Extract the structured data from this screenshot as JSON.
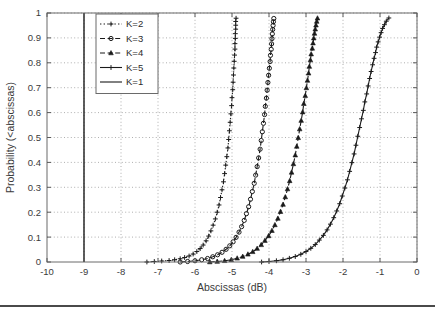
{
  "figure": {
    "bottom_rule_color": "#4a4a4a",
    "background": "#ffffff"
  },
  "chart_data": {
    "type": "line",
    "title": "",
    "subtitle": "",
    "xlabel": "Abscissas (dB)",
    "ylabel": "Probability (<abscissas)",
    "xlim": [
      -10,
      0
    ],
    "ylim": [
      0,
      1
    ],
    "xticks": [
      -10,
      -9,
      -8,
      -7,
      -6,
      -5,
      -4,
      -3,
      -2,
      -1,
      0
    ],
    "xticklabels": [
      "-10",
      "-9",
      "-8",
      "-7",
      "-6",
      "-5",
      "-4",
      "-3",
      "-2",
      "-1",
      "0"
    ],
    "yticks": [
      0,
      0.1,
      0.2,
      0.3,
      0.4,
      0.5,
      0.6,
      0.7,
      0.8,
      0.9,
      1
    ],
    "yticklabels": [
      "0",
      "0.1",
      "0.2",
      "0.3",
      "0.4",
      "0.5",
      "0.6",
      "0.7",
      "0.8",
      "0.9",
      "1"
    ],
    "grid": true,
    "grid_style": "dotted",
    "grid_color": "#9a9a9a",
    "legend_position": "upper left",
    "line_color": "#1a1a1a",
    "series": [
      {
        "name": "K=2",
        "legend_label": "K=2",
        "linestyle": "dotted",
        "marker": "plus",
        "color": "#1a1a1a",
        "points": [
          [
            -7.3,
            0.0
          ],
          [
            -7.1,
            0.002
          ],
          [
            -6.9,
            0.004
          ],
          [
            -6.7,
            0.006
          ],
          [
            -6.55,
            0.009
          ],
          [
            -6.4,
            0.013
          ],
          [
            -6.28,
            0.018
          ],
          [
            -6.16,
            0.024
          ],
          [
            -6.05,
            0.032
          ],
          [
            -5.95,
            0.042
          ],
          [
            -5.86,
            0.054
          ],
          [
            -5.78,
            0.068
          ],
          [
            -5.7,
            0.085
          ],
          [
            -5.63,
            0.104
          ],
          [
            -5.57,
            0.125
          ],
          [
            -5.51,
            0.148
          ],
          [
            -5.45,
            0.173
          ],
          [
            -5.4,
            0.2
          ],
          [
            -5.35,
            0.229
          ],
          [
            -5.31,
            0.259
          ],
          [
            -5.27,
            0.29
          ],
          [
            -5.23,
            0.322
          ],
          [
            -5.2,
            0.355
          ],
          [
            -5.17,
            0.389
          ],
          [
            -5.14,
            0.423
          ],
          [
            -5.11,
            0.458
          ],
          [
            -5.09,
            0.492
          ],
          [
            -5.07,
            0.527
          ],
          [
            -5.05,
            0.561
          ],
          [
            -5.03,
            0.595
          ],
          [
            -5.01,
            0.628
          ],
          [
            -5.0,
            0.66
          ],
          [
            -4.98,
            0.692
          ],
          [
            -4.97,
            0.722
          ],
          [
            -4.96,
            0.751
          ],
          [
            -4.95,
            0.779
          ],
          [
            -4.94,
            0.806
          ],
          [
            -4.93,
            0.831
          ],
          [
            -4.92,
            0.855
          ],
          [
            -4.92,
            0.877
          ],
          [
            -4.91,
            0.898
          ],
          [
            -4.91,
            0.917
          ],
          [
            -4.9,
            0.935
          ],
          [
            -4.9,
            0.951
          ],
          [
            -4.9,
            0.966
          ],
          [
            -4.89,
            0.979
          ]
        ]
      },
      {
        "name": "K=3",
        "legend_label": "K=3",
        "linestyle": "dashed",
        "marker": "circle",
        "color": "#1a1a1a",
        "points": [
          [
            -6.4,
            0.0
          ],
          [
            -6.2,
            0.002
          ],
          [
            -6.0,
            0.005
          ],
          [
            -5.82,
            0.009
          ],
          [
            -5.66,
            0.014
          ],
          [
            -5.52,
            0.021
          ],
          [
            -5.39,
            0.029
          ],
          [
            -5.27,
            0.039
          ],
          [
            -5.16,
            0.051
          ],
          [
            -5.06,
            0.065
          ],
          [
            -4.97,
            0.081
          ],
          [
            -4.89,
            0.099
          ],
          [
            -4.81,
            0.12
          ],
          [
            -4.74,
            0.142
          ],
          [
            -4.67,
            0.167
          ],
          [
            -4.61,
            0.194
          ],
          [
            -4.55,
            0.222
          ],
          [
            -4.5,
            0.252
          ],
          [
            -4.45,
            0.283
          ],
          [
            -4.4,
            0.316
          ],
          [
            -4.36,
            0.349
          ],
          [
            -4.32,
            0.383
          ],
          [
            -4.28,
            0.418
          ],
          [
            -4.24,
            0.453
          ],
          [
            -4.21,
            0.488
          ],
          [
            -4.18,
            0.523
          ],
          [
            -4.15,
            0.557
          ],
          [
            -4.12,
            0.592
          ],
          [
            -4.1,
            0.625
          ],
          [
            -4.07,
            0.658
          ],
          [
            -4.05,
            0.69
          ],
          [
            -4.03,
            0.721
          ],
          [
            -4.01,
            0.75
          ],
          [
            -3.99,
            0.778
          ],
          [
            -3.97,
            0.805
          ],
          [
            -3.96,
            0.83
          ],
          [
            -3.94,
            0.854
          ],
          [
            -3.93,
            0.876
          ],
          [
            -3.92,
            0.897
          ],
          [
            -3.91,
            0.916
          ],
          [
            -3.9,
            0.934
          ],
          [
            -3.89,
            0.95
          ],
          [
            -3.88,
            0.965
          ],
          [
            -3.87,
            0.978
          ]
        ]
      },
      {
        "name": "K=4",
        "legend_label": "K=4",
        "linestyle": "dashed",
        "marker": "triangle",
        "color": "#1a1a1a",
        "points": [
          [
            -5.6,
            0.0
          ],
          [
            -5.4,
            0.002
          ],
          [
            -5.2,
            0.005
          ],
          [
            -5.02,
            0.009
          ],
          [
            -4.86,
            0.015
          ],
          [
            -4.71,
            0.022
          ],
          [
            -4.57,
            0.031
          ],
          [
            -4.44,
            0.041
          ],
          [
            -4.32,
            0.054
          ],
          [
            -4.21,
            0.069
          ],
          [
            -4.11,
            0.086
          ],
          [
            -4.01,
            0.105
          ],
          [
            -3.92,
            0.126
          ],
          [
            -3.84,
            0.149
          ],
          [
            -3.76,
            0.175
          ],
          [
            -3.69,
            0.202
          ],
          [
            -3.62,
            0.231
          ],
          [
            -3.56,
            0.261
          ],
          [
            -3.5,
            0.293
          ],
          [
            -3.44,
            0.326
          ],
          [
            -3.39,
            0.36
          ],
          [
            -3.34,
            0.394
          ],
          [
            -3.29,
            0.429
          ],
          [
            -3.25,
            0.464
          ],
          [
            -3.21,
            0.499
          ],
          [
            -3.17,
            0.534
          ],
          [
            -3.13,
            0.568
          ],
          [
            -3.09,
            0.602
          ],
          [
            -3.06,
            0.636
          ],
          [
            -3.02,
            0.668
          ],
          [
            -2.99,
            0.699
          ],
          [
            -2.96,
            0.729
          ],
          [
            -2.93,
            0.758
          ],
          [
            -2.91,
            0.785
          ],
          [
            -2.88,
            0.811
          ],
          [
            -2.86,
            0.835
          ],
          [
            -2.83,
            0.858
          ],
          [
            -2.81,
            0.879
          ],
          [
            -2.79,
            0.899
          ],
          [
            -2.77,
            0.918
          ],
          [
            -2.75,
            0.935
          ],
          [
            -2.73,
            0.951
          ],
          [
            -2.71,
            0.966
          ],
          [
            -2.69,
            0.979
          ]
        ]
      },
      {
        "name": "K=5",
        "legend_label": "K=5",
        "linestyle": "solid",
        "marker": "plus",
        "color": "#1a1a1a",
        "points": [
          [
            -4.2,
            0.0
          ],
          [
            -4.0,
            0.002
          ],
          [
            -3.8,
            0.005
          ],
          [
            -3.62,
            0.009
          ],
          [
            -3.45,
            0.015
          ],
          [
            -3.29,
            0.022
          ],
          [
            -3.14,
            0.031
          ],
          [
            -3.0,
            0.042
          ],
          [
            -2.87,
            0.055
          ],
          [
            -2.75,
            0.07
          ],
          [
            -2.64,
            0.088
          ],
          [
            -2.53,
            0.107
          ],
          [
            -2.43,
            0.129
          ],
          [
            -2.34,
            0.152
          ],
          [
            -2.25,
            0.178
          ],
          [
            -2.17,
            0.205
          ],
          [
            -2.09,
            0.234
          ],
          [
            -2.02,
            0.265
          ],
          [
            -1.95,
            0.297
          ],
          [
            -1.88,
            0.33
          ],
          [
            -1.82,
            0.364
          ],
          [
            -1.76,
            0.399
          ],
          [
            -1.7,
            0.434
          ],
          [
            -1.65,
            0.469
          ],
          [
            -1.6,
            0.505
          ],
          [
            -1.55,
            0.54
          ],
          [
            -1.5,
            0.575
          ],
          [
            -1.45,
            0.609
          ],
          [
            -1.41,
            0.643
          ],
          [
            -1.36,
            0.675
          ],
          [
            -1.32,
            0.707
          ],
          [
            -1.28,
            0.737
          ],
          [
            -1.24,
            0.765
          ],
          [
            -1.2,
            0.792
          ],
          [
            -1.16,
            0.818
          ],
          [
            -1.12,
            0.841
          ],
          [
            -1.09,
            0.863
          ],
          [
            -1.05,
            0.884
          ],
          [
            -1.01,
            0.903
          ],
          [
            -0.97,
            0.921
          ],
          [
            -0.93,
            0.938
          ],
          [
            -0.88,
            0.953
          ],
          [
            -0.83,
            0.967
          ],
          [
            -0.76,
            0.98
          ]
        ]
      },
      {
        "name": "K=1",
        "legend_label": "K=1",
        "linestyle": "solid",
        "marker": "none",
        "color": "#1a1a1a",
        "points": [
          [
            -9.0,
            0.0
          ],
          [
            -9.0,
            1.0
          ]
        ]
      }
    ]
  }
}
